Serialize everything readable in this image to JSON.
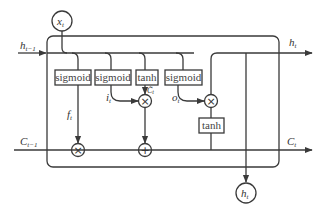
{
  "diagram": {
    "title": "",
    "type": "LSTM cell",
    "inputs": {
      "x": {
        "label": "x",
        "sub": "t"
      },
      "h_prev": {
        "label": "h",
        "sub": "t−1"
      },
      "c_prev": {
        "label": "C",
        "sub": "t−1"
      }
    },
    "outputs": {
      "h_right": {
        "label": "h",
        "sub": "t"
      },
      "c_right": {
        "label": "C",
        "sub": "t"
      },
      "h_bottom": {
        "label": "h",
        "sub": "t"
      }
    },
    "gates": [
      {
        "id": "forget",
        "label": "sigmoid",
        "signal": {
          "label": "f",
          "sub": "t"
        }
      },
      {
        "id": "input",
        "label": "sigmoid",
        "signal": {
          "label": "i",
          "sub": "t"
        }
      },
      {
        "id": "candidate",
        "label": "tanh",
        "signal": {
          "label": "C̃",
          "sub": "t"
        }
      },
      {
        "id": "output",
        "label": "sigmoid",
        "signal": {
          "label": "o",
          "sub": "t"
        }
      }
    ],
    "cell_tanh": {
      "label": "tanh"
    },
    "operators": {
      "multiply": "×",
      "add": "+"
    },
    "colors": {
      "line": "#3a3a3a",
      "background": "#ffffff",
      "box_fill": "#ffffff"
    }
  }
}
